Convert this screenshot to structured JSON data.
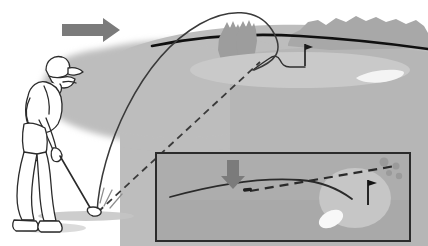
{
  "figure": {
    "type": "line-art-diagram",
    "width": 428,
    "height": 246,
    "background_color": "#ffffff"
  },
  "palette": {
    "background": "#ffffff",
    "fairway_light": "#b9b9b9",
    "fairway_mid": "#b3b3b3",
    "green_surface": "#c9c9c9",
    "shadow_gray": "#bdbdbd",
    "hill_gray": "#a8a8a8",
    "tree_gray": "#9d9d9d",
    "arrow_gray": "#7b7b7b",
    "bunker_white": "#f2f2f2",
    "outline_black": "#1a1a1a",
    "line_dark": "#3a3a3a",
    "inset_fill": "#ababab",
    "inset_border": "#2b2b2b",
    "golfer_outline": "#2b2b2b",
    "golfer_fill": "#ffffff"
  },
  "scene": {
    "main_view": {
      "name": "side-elevation-view",
      "elements": [
        {
          "id": "direction-arrow",
          "label": "wind or play direction arrow",
          "direction": "right",
          "color": "#7b7b7b",
          "position": {
            "x": 62,
            "y": 22,
            "width": 58,
            "height": 18
          }
        },
        {
          "id": "golfer",
          "label": "golfer at address with club",
          "position": {
            "x": 4,
            "y": 55,
            "width": 105,
            "height": 175
          }
        },
        {
          "id": "ball",
          "label": "golf ball at address",
          "position": {
            "x": 95,
            "y": 212
          }
        },
        {
          "id": "horizon-ridge",
          "label": "ridge line / crest of hill",
          "color": "#1a1a1a"
        },
        {
          "id": "trees",
          "label": "tree cluster behind crest",
          "count": 2,
          "position": {
            "x": 216,
            "y": 22
          }
        },
        {
          "id": "rocky-hill",
          "label": "rocky hill background right",
          "color": "#a8a8a8"
        },
        {
          "id": "putting-green",
          "label": "putting green surface",
          "color": "#c9c9c9"
        },
        {
          "id": "flagstick",
          "label": "flagstick with pin flag on green",
          "position": {
            "x": 305,
            "y": 44
          }
        },
        {
          "id": "greenside-bunker",
          "label": "greenside sand bunker",
          "color": "#f2f2f2",
          "position": {
            "x": 358,
            "y": 72
          }
        },
        {
          "id": "ball-flight-arc",
          "label": "solid ball flight trajectory arc",
          "style": "solid",
          "color": "#3a3a3a"
        },
        {
          "id": "sight-line",
          "label": "dashed line of sight from ball to target",
          "style": "dashed",
          "color": "#3a3a3a"
        },
        {
          "id": "roll-out-path",
          "label": "ball roll out path on green",
          "style": "solid",
          "color": "#3a3a3a"
        }
      ]
    },
    "inset_view": {
      "name": "inset-detail-view",
      "label": "inset close-up of ball landing and roll on the green",
      "border_color": "#2b2b2b",
      "fill_color": "#ababab",
      "position": {
        "x": 156,
        "y": 153,
        "width": 254,
        "height": 88
      },
      "elements": [
        {
          "id": "inset-down-arrow",
          "label": "descent / landing direction arrow",
          "direction": "down",
          "color": "#7b7b7b",
          "position": {
            "x": 232,
            "y": 161
          }
        },
        {
          "id": "inset-slope-line",
          "label": "slope contour of the green, solid curve",
          "style": "solid"
        },
        {
          "id": "inset-approach-dashed",
          "label": "dashed incoming shot line",
          "style": "dashed"
        },
        {
          "id": "inset-landing-mark",
          "label": "ball landing / pitch mark",
          "position": {
            "x": 246,
            "y": 191
          }
        },
        {
          "id": "inset-green",
          "label": "putting green circle in detail view",
          "color": "#c9c9c9"
        },
        {
          "id": "inset-flagstick",
          "label": "flagstick in detail view",
          "position": {
            "x": 368,
            "y": 183
          }
        },
        {
          "id": "inset-bunker",
          "label": "sand bunker in detail view",
          "color": "#f8f8f8"
        },
        {
          "id": "inset-ball-marks",
          "label": "small ball position dots upper right",
          "count": 4
        }
      ]
    }
  }
}
